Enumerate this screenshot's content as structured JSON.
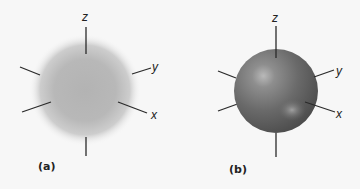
{
  "figure": {
    "panels": [
      {
        "id": "a",
        "label": "(a)",
        "description": "diffuse spherical s orbital probability density",
        "axes": {
          "z": "z",
          "y": "y",
          "x": "x"
        },
        "color": "#b5b5b5"
      },
      {
        "id": "b",
        "label": "(b)",
        "description": "solid shaded sphere boundary surface",
        "axes": {
          "z": "z",
          "y": "y",
          "x": "x"
        },
        "color": "#6e6e6e"
      }
    ]
  }
}
